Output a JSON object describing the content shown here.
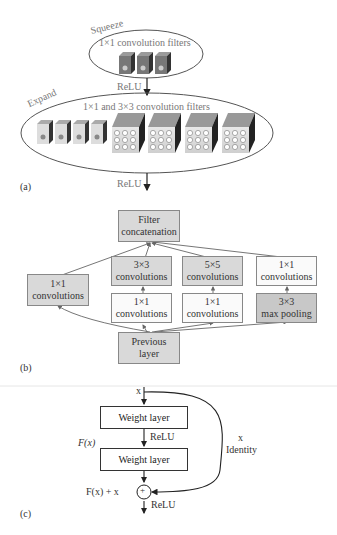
{
  "panel_a": {
    "label": "(a)",
    "squeeze": {
      "title": "Squeeze",
      "caption": "1×1 convolution filters",
      "filter_count": 3
    },
    "relu_1": "ReLU",
    "expand": {
      "title": "Expand",
      "caption": "1×1 and 3×3 convolution filters",
      "small_filters": 4,
      "large_filters": 4
    },
    "relu_2": "ReLU"
  },
  "panel_b": {
    "label": "(b)",
    "filter_concat": {
      "line1": "Filter",
      "line2": "concatenation"
    },
    "branch1": {
      "line1": "1×1",
      "line2": "convolutions"
    },
    "conv3x3": {
      "line1": "3×3",
      "line2": "convolutions"
    },
    "conv5x5": {
      "line1": "5×5",
      "line2": "convolutions"
    },
    "conv1x1_top": {
      "line1": "1×1",
      "line2": "convolutions"
    },
    "reduce1": {
      "line1": "1×1",
      "line2": "convolutions"
    },
    "reduce2": {
      "line1": "1×1",
      "line2": "convolutions"
    },
    "maxpool": {
      "line1": "3×3",
      "line2": "max pooling"
    },
    "previous": {
      "line1": "Previous",
      "line2": "layer"
    }
  },
  "panel_c": {
    "label": "(c)",
    "input": "x",
    "weight1": "Weight layer",
    "relu_mid": "ReLU",
    "fx": "F(x)",
    "weight2": "Weight layer",
    "identity_x": "x",
    "identity": "Identity",
    "sum": "F(x) + x",
    "plus": "+",
    "relu_out": "ReLU"
  },
  "colors": {
    "box_fill": "#d9d9d9",
    "box_white": "#fafafa",
    "line": "#555555",
    "text_gray": "#777777"
  }
}
